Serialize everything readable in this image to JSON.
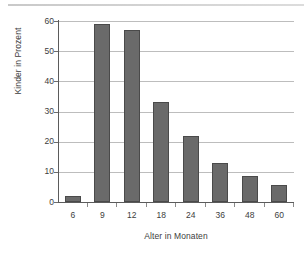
{
  "chart_data": {
    "type": "bar",
    "title": "",
    "xlabel": "Alter in Monaten",
    "ylabel": "Kinder in Prozent",
    "categories": [
      "6",
      "9",
      "12",
      "18",
      "24",
      "36",
      "48",
      "60"
    ],
    "values": [
      2,
      59,
      57,
      33,
      22,
      13,
      8.5,
      5.5
    ],
    "ylim": [
      0,
      60
    ],
    "ytick_labels": [
      "60",
      "50",
      "40",
      "30",
      "20",
      "10",
      "0"
    ],
    "ytick_values": [
      60,
      50,
      40,
      30,
      20,
      10,
      0
    ],
    "grid": true,
    "legend": null,
    "series": [
      {
        "name": "Kinder in Prozent",
        "values": [
          2,
          59,
          57,
          33,
          22,
          13,
          8.5,
          5.5
        ]
      }
    ],
    "colors": {
      "bar_fill": "#6a6a6a",
      "bar_border": "#4a4a4a",
      "gridline": "#bdbdbd",
      "axis": "#5b5b5b",
      "text": "#3d3d3d",
      "background": "#ffffff"
    }
  }
}
